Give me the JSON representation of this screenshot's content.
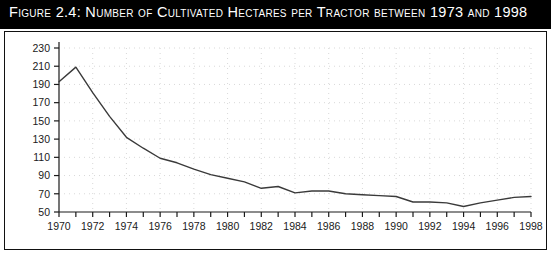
{
  "figure": {
    "title": "Figure 2.4:  Number of Cultivated Hectares per Tractor between 1973 and 1998",
    "title_bar_color": "#000000",
    "title_text_color": "#ffffff",
    "panel_background": "#ffffff",
    "panel_border_color": "#111111"
  },
  "chart_data": {
    "type": "line",
    "title": "Number of Cultivated Hectares per Tractor between 1973 and 1998",
    "xlabel": "",
    "ylabel": "",
    "xlim": [
      1970,
      1998
    ],
    "ylim": [
      50,
      230
    ],
    "ytick_step": 20,
    "xtick_step": 1,
    "xtick_label_step": 2,
    "grid": true,
    "grid_style": "dotted",
    "grid_color": "#d9d9d9",
    "legend": false,
    "line_color": "#3a3a3a",
    "line_width": 1.4,
    "axis_color": "#1a1a1a",
    "y_ticks": [
      50,
      70,
      90,
      110,
      130,
      150,
      170,
      190,
      210,
      230
    ],
    "x_tick_labels": [
      "1970",
      "1972",
      "1974",
      "1976",
      "1978",
      "1980",
      "1982",
      "1984",
      "1986",
      "1988",
      "1990",
      "1992",
      "1994",
      "1996",
      "1998"
    ],
    "x": [
      1970,
      1971,
      1972,
      1973,
      1974,
      1975,
      1976,
      1977,
      1978,
      1979,
      1980,
      1981,
      1982,
      1983,
      1984,
      1985,
      1986,
      1987,
      1988,
      1989,
      1990,
      1991,
      1992,
      1993,
      1994,
      1995,
      1996,
      1997,
      1998
    ],
    "series": [
      {
        "name": "Hectares per tractor",
        "values": [
          193,
          209,
          181,
          155,
          132,
          120,
          109,
          104,
          97,
          91,
          87,
          83,
          76,
          78,
          71,
          73,
          73,
          70,
          69,
          68,
          67,
          61,
          61,
          60,
          56,
          60,
          63,
          66,
          67
        ]
      }
    ]
  }
}
